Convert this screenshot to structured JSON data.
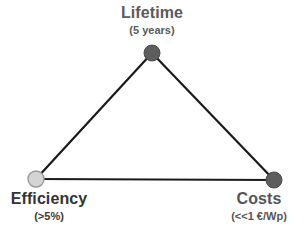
{
  "diagram": {
    "type": "triangle-tradeoff",
    "background_color": "#ffffff",
    "edge_color": "#1a1a1a",
    "edge_width": 2.2,
    "vertices": [
      {
        "id": "lifetime",
        "title": "Lifetime",
        "subtitle": "(5 years)",
        "x": 152,
        "y": 53,
        "radius": 8,
        "fill": "#5d5d5d",
        "stroke": "#4a4a4a",
        "title_color": "#5a5a5a",
        "label_position": "above"
      },
      {
        "id": "efficiency",
        "title": "Efficiency",
        "subtitle": "(>5%)",
        "x": 36,
        "y": 179,
        "radius": 8,
        "fill": "#d4d4d4",
        "stroke": "#9a9a9a",
        "title_color": "#333333",
        "label_position": "below"
      },
      {
        "id": "costs",
        "title": "Costs",
        "subtitle": "(<<1 €/Wp)",
        "x": 274,
        "y": 180,
        "radius": 8,
        "fill": "#5d5d5d",
        "stroke": "#4a4a4a",
        "title_color": "#555555",
        "label_position": "below"
      }
    ],
    "edges": [
      {
        "from": "efficiency",
        "to": "lifetime"
      },
      {
        "from": "lifetime",
        "to": "costs"
      },
      {
        "from": "efficiency",
        "to": "costs"
      }
    ]
  }
}
